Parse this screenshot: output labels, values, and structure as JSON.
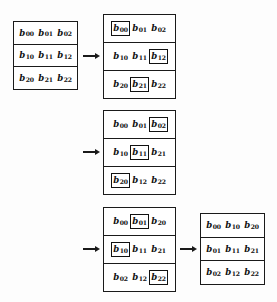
{
  "figure": {
    "background_color": "#fdfdfd",
    "ink_color": "#1a1a1a",
    "symbol": "b",
    "matrices": [
      {
        "id": "matrix-1",
        "caption": "original matrix B",
        "x": 13,
        "y": 21,
        "width": 65,
        "height": 69,
        "rows": [
          [
            {
              "sym": "b",
              "sub": "00",
              "boxed": false
            },
            {
              "sym": "b",
              "sub": "01",
              "boxed": false
            },
            {
              "sym": "b",
              "sub": "02",
              "boxed": false
            }
          ],
          [
            {
              "sym": "b",
              "sub": "10",
              "boxed": false
            },
            {
              "sym": "b",
              "sub": "11",
              "boxed": false
            },
            {
              "sym": "b",
              "sub": "12",
              "boxed": false
            }
          ],
          [
            {
              "sym": "b",
              "sub": "20",
              "boxed": false
            },
            {
              "sym": "b",
              "sub": "21",
              "boxed": false
            },
            {
              "sym": "b",
              "sub": "22",
              "boxed": false
            }
          ]
        ]
      },
      {
        "id": "matrix-2",
        "caption": "step 1 highlighted elements",
        "x": 103,
        "y": 14,
        "width": 73,
        "height": 85,
        "rows": [
          [
            {
              "sym": "b",
              "sub": "00",
              "boxed": true
            },
            {
              "sym": "b",
              "sub": "01",
              "boxed": false
            },
            {
              "sym": "b",
              "sub": "02",
              "boxed": false
            }
          ],
          [
            {
              "sym": "b",
              "sub": "10",
              "boxed": false
            },
            {
              "sym": "b",
              "sub": "11",
              "boxed": false
            },
            {
              "sym": "b",
              "sub": "12",
              "boxed": true
            }
          ],
          [
            {
              "sym": "b",
              "sub": "20",
              "boxed": false
            },
            {
              "sym": "b",
              "sub": "21",
              "boxed": true
            },
            {
              "sym": "b",
              "sub": "22",
              "boxed": false
            }
          ]
        ]
      },
      {
        "id": "matrix-3",
        "caption": "step 2 highlighted elements",
        "x": 103,
        "y": 110,
        "width": 73,
        "height": 85,
        "rows": [
          [
            {
              "sym": "b",
              "sub": "00",
              "boxed": false
            },
            {
              "sym": "b",
              "sub": "01",
              "boxed": false
            },
            {
              "sym": "b",
              "sub": "02",
              "boxed": true
            }
          ],
          [
            {
              "sym": "b",
              "sub": "10",
              "boxed": false
            },
            {
              "sym": "b",
              "sub": "11",
              "boxed": true
            },
            {
              "sym": "b",
              "sub": "21",
              "boxed": false
            }
          ],
          [
            {
              "sym": "b",
              "sub": "20",
              "boxed": true
            },
            {
              "sym": "b",
              "sub": "12",
              "boxed": false
            },
            {
              "sym": "b",
              "sub": "22",
              "boxed": false
            }
          ]
        ]
      },
      {
        "id": "matrix-4",
        "caption": "step 3 highlighted elements",
        "x": 103,
        "y": 207,
        "width": 73,
        "height": 85,
        "rows": [
          [
            {
              "sym": "b",
              "sub": "00",
              "boxed": false
            },
            {
              "sym": "b",
              "sub": "01",
              "boxed": true
            },
            {
              "sym": "b",
              "sub": "20",
              "boxed": false
            }
          ],
          [
            {
              "sym": "b",
              "sub": "10",
              "boxed": true
            },
            {
              "sym": "b",
              "sub": "11",
              "boxed": false
            },
            {
              "sym": "b",
              "sub": "21",
              "boxed": false
            }
          ],
          [
            {
              "sym": "b",
              "sub": "02",
              "boxed": false
            },
            {
              "sym": "b",
              "sub": "12",
              "boxed": false
            },
            {
              "sym": "b",
              "sub": "22",
              "boxed": true
            }
          ]
        ]
      },
      {
        "id": "matrix-5",
        "caption": "final transposed matrix",
        "x": 200,
        "y": 213,
        "width": 65,
        "height": 72,
        "rows": [
          [
            {
              "sym": "b",
              "sub": "00",
              "boxed": false
            },
            {
              "sym": "b",
              "sub": "10",
              "boxed": false
            },
            {
              "sym": "b",
              "sub": "20",
              "boxed": false
            }
          ],
          [
            {
              "sym": "b",
              "sub": "01",
              "boxed": false
            },
            {
              "sym": "b",
              "sub": "11",
              "boxed": false
            },
            {
              "sym": "b",
              "sub": "21",
              "boxed": false
            }
          ],
          [
            {
              "sym": "b",
              "sub": "02",
              "boxed": false
            },
            {
              "sym": "b",
              "sub": "12",
              "boxed": false
            },
            {
              "sym": "b",
              "sub": "22",
              "boxed": false
            }
          ]
        ]
      }
    ],
    "arrows": [
      {
        "id": "arrow-1",
        "x": 83,
        "y": 51,
        "width": 17,
        "direction": "right"
      },
      {
        "id": "arrow-2",
        "x": 83,
        "y": 147,
        "width": 17,
        "direction": "right"
      },
      {
        "id": "arrow-3",
        "x": 83,
        "y": 244,
        "width": 17,
        "direction": "right"
      },
      {
        "id": "arrow-4",
        "x": 180,
        "y": 244,
        "width": 17,
        "direction": "right"
      }
    ]
  }
}
